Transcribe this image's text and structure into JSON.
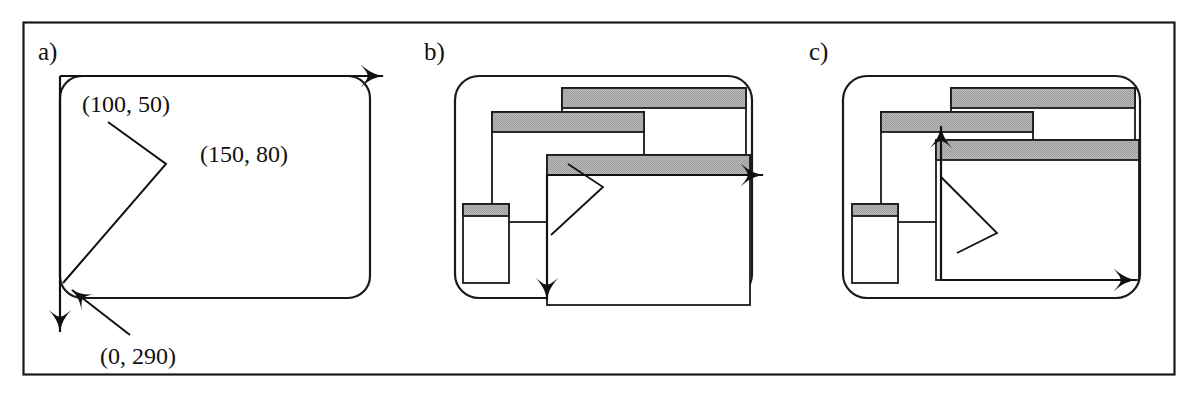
{
  "figure": {
    "width": 1198,
    "height": 398,
    "background": "#ffffff",
    "border_color": "#1a1a1a",
    "stroke_color": "#1a1a1a",
    "titlebar_fill": "#b3b3b3",
    "window_fill": "#ffffff"
  },
  "panels": [
    {
      "id": "a",
      "label": "a)",
      "label_x": 38,
      "label_y": 58,
      "screen": {
        "x": 60,
        "y": 76,
        "w": 310,
        "h": 222,
        "r": 20
      },
      "coord_labels": [
        {
          "name": "start-point",
          "text": "(100, 50)",
          "x": 82,
          "y": 112
        },
        {
          "name": "mid-point",
          "text": "(150, 80)",
          "x": 198,
          "y": 160
        },
        {
          "name": "end-point",
          "text": "(0, 290)",
          "x": 100,
          "y": 362
        }
      ],
      "stroke_path": {
        "name": "pen-stroke-path",
        "points": "[(108,122) -> (165,163) -> (63,283)]"
      },
      "arrows": [
        {
          "name": "x-axis-arrow",
          "direction": "right",
          "from_x": 60,
          "from_y": 76,
          "to_x": 396,
          "to_y": 76
        },
        {
          "name": "y-axis-arrow",
          "direction": "down",
          "from_x": 60,
          "from_y": 76,
          "to_x": 60,
          "to_y": 344
        },
        {
          "name": "end-point-leader-arrow",
          "direction": "up-left",
          "from_x": 128,
          "from_y": 333,
          "to_x": 66,
          "to_y": 284
        }
      ]
    },
    {
      "id": "b",
      "label": "b)",
      "label_x": 424,
      "label_y": 58,
      "screen": {
        "x": 455,
        "y": 76,
        "w": 297,
        "h": 222,
        "r": 22
      },
      "windows": [
        {
          "name": "window-back",
          "x": 562,
          "y": 88,
          "w": 184,
          "h": 84,
          "titlebar_h": 20
        },
        {
          "name": "window-middle",
          "x": 492,
          "y": 112,
          "w": 152,
          "h": 110,
          "titlebar_h": 20
        },
        {
          "name": "window-front",
          "x": 547,
          "y": 155,
          "w": 203,
          "h": 150,
          "titlebar_h": 20
        },
        {
          "name": "window-small",
          "x": 463,
          "y": 204,
          "w": 46,
          "h": 79,
          "titlebar_h": 12
        }
      ],
      "stroke_path": {
        "name": "pen-stroke-path",
        "points": "[(568,164) -> (602,187) -> (551,234)]"
      },
      "arrows": [
        {
          "name": "x-axis-arrow",
          "direction": "right",
          "from_x": 547,
          "from_y": 175,
          "to_x": 775,
          "to_y": 175
        },
        {
          "name": "y-axis-arrow",
          "direction": "down",
          "from_x": 547,
          "from_y": 175,
          "to_x": 547,
          "to_y": 312
        }
      ]
    },
    {
      "id": "c",
      "label": "c)",
      "label_x": 809,
      "label_y": 58,
      "screen": {
        "x": 843,
        "y": 76,
        "w": 297,
        "h": 222,
        "r": 22
      },
      "windows": [
        {
          "name": "window-back",
          "x": 951,
          "y": 88,
          "w": 184,
          "h": 84,
          "titlebar_h": 20
        },
        {
          "name": "window-middle",
          "x": 881,
          "y": 112,
          "w": 152,
          "h": 110,
          "titlebar_h": 20
        },
        {
          "name": "window-front",
          "x": 936,
          "y": 140,
          "w": 203,
          "h": 140,
          "titlebar_h": 20
        },
        {
          "name": "window-small",
          "x": 852,
          "y": 204,
          "w": 46,
          "h": 79,
          "titlebar_h": 12
        }
      ],
      "stroke_path": {
        "name": "pen-stroke-path",
        "points": "[(941,177) -> (996,233) -> (957,253)]"
      },
      "arrows": [
        {
          "name": "y-axis-arrow",
          "direction": "up",
          "from_x": 941,
          "from_y": 280,
          "to_x": 941,
          "to_y": 114
        },
        {
          "name": "x-axis-arrow",
          "direction": "right",
          "from_x": 941,
          "from_y": 280,
          "to_x": 1148,
          "to_y": 280
        }
      ]
    }
  ]
}
